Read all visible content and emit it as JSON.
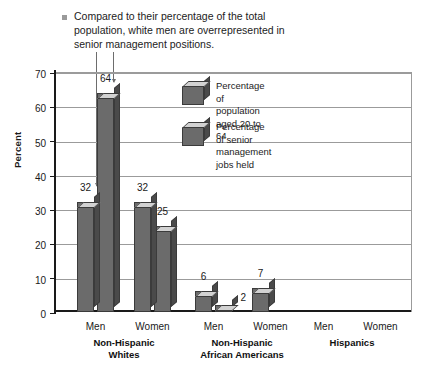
{
  "caption": {
    "bullet_color": "#9a9a9a",
    "text": "Compared to their percentage of the total population, white men are overrepresented in senior management positions."
  },
  "axis": {
    "ylabel": "Percent",
    "yticks": [
      "0",
      "10",
      "20",
      "30",
      "40",
      "50",
      "60",
      "70"
    ]
  },
  "legend": {
    "items": [
      {
        "label": "Percentage of population\naged 20 to 64"
      },
      {
        "label": "Percentage of senior\nmanagement jobs held"
      }
    ]
  },
  "groups": [
    {
      "name": "Non-Hispanic\nWhites",
      "subs": [
        "Men",
        "Women"
      ],
      "values": [
        32,
        64,
        32,
        25
      ]
    },
    {
      "name": "Non-Hispanic\nAfrican Americans",
      "subs": [
        "Men",
        "Women"
      ],
      "values": [
        6,
        2,
        7,
        1
      ]
    },
    {
      "name": "Hispanics",
      "subs": [
        "Men",
        "Women"
      ],
      "values": [
        8,
        2,
        8,
        1
      ]
    }
  ],
  "chart_data": {
    "type": "bar",
    "title": "Compared to their percentage of the total population, white men are overrepresented in senior management positions.",
    "xlabel": "",
    "ylabel": "Percent",
    "ylim": [
      0,
      70
    ],
    "ytick_step": 10,
    "grid": true,
    "legend_position": "inside-top-center",
    "style": "3d-column",
    "categories": [
      "Non-Hispanic Whites - Men",
      "Non-Hispanic Whites - Women",
      "Non-Hispanic African Americans - Men",
      "Non-Hispanic African Americans - Women",
      "Hispanics - Men",
      "Hispanics - Women"
    ],
    "series": [
      {
        "name": "Percentage of population aged 20 to 64",
        "values": [
          32,
          32,
          6,
          7,
          8,
          8
        ]
      },
      {
        "name": "Percentage of senior management jobs held",
        "values": [
          64,
          25,
          2,
          1,
          2,
          1
        ]
      }
    ],
    "annotations": [
      "Leader line from caption to Non-Hispanic Whites Men population bar (32)",
      "Leader line from caption to Non-Hispanic Whites Men senior management bar (64)"
    ]
  }
}
